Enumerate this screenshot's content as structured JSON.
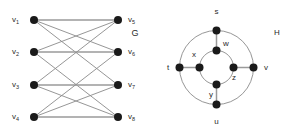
{
  "figure": {
    "background_color": "#ffffff",
    "node_color": "#1a1a1a",
    "edge_color": "#8a8a8a"
  },
  "graph_g": {
    "name": "G",
    "label": "G",
    "type": "bipartite",
    "label_position": {
      "x": 135,
      "y": 36
    },
    "left_column": [
      {
        "id": "v1",
        "base": "v",
        "sub": "1",
        "x": 34,
        "y": 20,
        "label_x": 19,
        "label_y": 22
      },
      {
        "id": "v2",
        "base": "v",
        "sub": "2",
        "x": 34,
        "y": 52,
        "label_x": 19,
        "label_y": 54
      },
      {
        "id": "v3",
        "base": "v",
        "sub": "3",
        "x": 34,
        "y": 85,
        "label_x": 19,
        "label_y": 87
      },
      {
        "id": "v4",
        "base": "v",
        "sub": "4",
        "x": 34,
        "y": 117,
        "label_x": 19,
        "label_y": 119
      }
    ],
    "right_column": [
      {
        "id": "v5",
        "base": "v",
        "sub": "5",
        "x": 118,
        "y": 20,
        "label_x": 128,
        "label_y": 22
      },
      {
        "id": "v6",
        "base": "v",
        "sub": "6",
        "x": 118,
        "y": 52,
        "label_x": 128,
        "label_y": 54
      },
      {
        "id": "v7",
        "base": "v",
        "sub": "7",
        "x": 118,
        "y": 85,
        "label_x": 128,
        "label_y": 87
      },
      {
        "id": "v8",
        "base": "v",
        "sub": "8",
        "x": 118,
        "y": 117,
        "label_x": 128,
        "label_y": 119
      }
    ],
    "node_radius": 4,
    "edges": [
      {
        "from": "v1",
        "to": "v5",
        "style": "thick"
      },
      {
        "from": "v1",
        "to": "v6",
        "style": "thin"
      },
      {
        "from": "v1",
        "to": "v7",
        "style": "thin"
      },
      {
        "from": "v2",
        "to": "v5",
        "style": "thin"
      },
      {
        "from": "v2",
        "to": "v6",
        "style": "thick"
      },
      {
        "from": "v2",
        "to": "v8",
        "style": "thin"
      },
      {
        "from": "v3",
        "to": "v5",
        "style": "thin"
      },
      {
        "from": "v3",
        "to": "v7",
        "style": "thick"
      },
      {
        "from": "v3",
        "to": "v8",
        "style": "thin"
      },
      {
        "from": "v4",
        "to": "v6",
        "style": "thin"
      },
      {
        "from": "v4",
        "to": "v7",
        "style": "thin"
      },
      {
        "from": "v4",
        "to": "v8",
        "style": "thick"
      }
    ]
  },
  "graph_h": {
    "name": "H",
    "label": "H",
    "type": "concentric-cycles",
    "label_position": {
      "x": 277,
      "y": 35
    },
    "center": {
      "x": 216.5,
      "y": 67.5
    },
    "outer_radius": 37,
    "inner_radius": 17,
    "node_radius": 4,
    "outer_nodes": [
      {
        "id": "s",
        "label": "s",
        "x": 216.5,
        "y": 30.5,
        "label_x": 216.5,
        "label_y": 14,
        "anchor": "middle"
      },
      {
        "id": "v",
        "label": "v",
        "x": 253.5,
        "y": 67.5,
        "label_x": 266,
        "label_y": 70,
        "anchor": "middle"
      },
      {
        "id": "u",
        "label": "u",
        "x": 216.5,
        "y": 104.5,
        "label_x": 216.5,
        "label_y": 124,
        "anchor": "middle"
      },
      {
        "id": "t",
        "label": "t",
        "x": 179.5,
        "y": 67.5,
        "label_x": 168,
        "label_y": 70,
        "anchor": "middle"
      }
    ],
    "inner_nodes": [
      {
        "id": "w",
        "label": "w",
        "x": 216.5,
        "y": 50.5,
        "label_x": 223,
        "label_y": 46,
        "anchor": "start"
      },
      {
        "id": "z",
        "label": "z",
        "x": 233.5,
        "y": 67.5,
        "label_x": 234,
        "label_y": 80,
        "anchor": "middle"
      },
      {
        "id": "y",
        "label": "y",
        "x": 216.5,
        "y": 84.5,
        "label_x": 211,
        "label_y": 97,
        "anchor": "middle"
      },
      {
        "id": "x",
        "label": "x",
        "x": 199.5,
        "y": 67.5,
        "label_x": 194,
        "label_y": 57,
        "anchor": "middle"
      }
    ],
    "outer_cycle": [
      "s",
      "v",
      "u",
      "t"
    ],
    "inner_cycle": [
      "w",
      "z",
      "y",
      "x"
    ],
    "spokes": [
      {
        "outer": "s",
        "inner": "w"
      },
      {
        "outer": "v",
        "inner": "z"
      },
      {
        "outer": "u",
        "inner": "y"
      },
      {
        "outer": "t",
        "inner": "x"
      }
    ]
  }
}
